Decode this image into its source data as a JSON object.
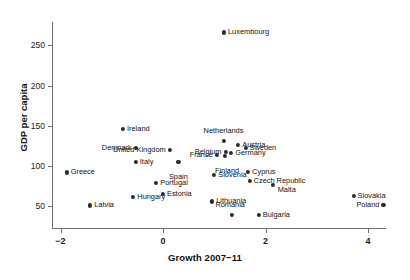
{
  "chart_data": {
    "type": "scatter",
    "title": "",
    "xlabel": "Growth 2007−11",
    "ylabel": "GDP per capita",
    "xlim": [
      -2.45,
      4.75
    ],
    "ylim": [
      32,
      278
    ],
    "xticks": [
      -2,
      0,
      2,
      4
    ],
    "xticklabels": [
      "−2",
      "0",
      "2",
      "4"
    ],
    "yticks": [
      50,
      100,
      150,
      200,
      250
    ],
    "yticklabels": [
      "50",
      "100",
      "150",
      "200",
      "250"
    ],
    "grid": false,
    "legend": "none",
    "marker_color": "#2b2b2b",
    "axis_color": "#6e6e6e",
    "points": [
      {
        "label": "Luxembourg",
        "x": 1.19,
        "y": 266,
        "pos": "right"
      },
      {
        "label": "Ireland",
        "x": -0.78,
        "y": 146,
        "pos": "right"
      },
      {
        "label": "Netherlands",
        "x": 1.18,
        "y": 131,
        "pos": "above"
      },
      {
        "label": "Austria",
        "x": 1.47,
        "y": 126,
        "pos": "right"
      },
      {
        "label": "Denmark",
        "x": -0.53,
        "y": 123,
        "pos": "left"
      },
      {
        "label": "Sweden",
        "x": 1.61,
        "y": 122,
        "pos": "right"
      },
      {
        "label": "United Kingdom",
        "x": 0.13,
        "y": 120,
        "pos": "left"
      },
      {
        "label": "Belgium",
        "x": 1.22,
        "y": 118,
        "pos": "left"
      },
      {
        "label": "Germany",
        "x": 1.33,
        "y": 116,
        "pos": "right"
      },
      {
        "label": "France",
        "x": 1.05,
        "y": 114,
        "pos": "left"
      },
      {
        "label": "Finland",
        "x": 1.21,
        "y": 113,
        "pos": "below"
      },
      {
        "label": "Italy",
        "x": -0.53,
        "y": 105,
        "pos": "right"
      },
      {
        "label": "Spain",
        "x": 0.3,
        "y": 105,
        "pos": "below"
      },
      {
        "label": "Greece",
        "x": -1.88,
        "y": 92,
        "pos": "right"
      },
      {
        "label": "Cyprus",
        "x": 1.66,
        "y": 93,
        "pos": "right"
      },
      {
        "label": "Slovenia",
        "x": 1.0,
        "y": 89,
        "pos": "right"
      },
      {
        "label": "Czech Republic",
        "x": 1.69,
        "y": 81,
        "pos": "right"
      },
      {
        "label": "Portugal",
        "x": -0.13,
        "y": 79,
        "pos": "right"
      },
      {
        "label": "Malta",
        "x": 2.14,
        "y": 76,
        "pos": "right"
      },
      {
        "label": "Estonia",
        "x": 0.0,
        "y": 65,
        "pos": "right"
      },
      {
        "label": "Slovakia",
        "x": 3.72,
        "y": 63,
        "pos": "right"
      },
      {
        "label": "Hungary",
        "x": -0.58,
        "y": 62,
        "pos": "right"
      },
      {
        "label": "Lithuania",
        "x": 0.96,
        "y": 56,
        "pos": "right"
      },
      {
        "label": "Latvia",
        "x": -1.42,
        "y": 51,
        "pos": "right"
      },
      {
        "label": "Poland",
        "x": 4.3,
        "y": 52,
        "pos": "left"
      },
      {
        "label": "Bulgaria",
        "x": 1.87,
        "y": 39,
        "pos": "right"
      },
      {
        "label": "Romania",
        "x": 1.35,
        "y": 39,
        "pos": "above"
      }
    ],
    "label_offsets": {
      "Spain": {
        "dx": 0,
        "dy": 8
      },
      "Finland": {
        "dx": 2,
        "dy": 8
      },
      "Netherlands": {
        "dx": 0,
        "dy": -4
      },
      "Romania": {
        "dx": -2,
        "dy": -4
      },
      "Malta": {
        "dx": 1,
        "dy": 5
      }
    }
  }
}
